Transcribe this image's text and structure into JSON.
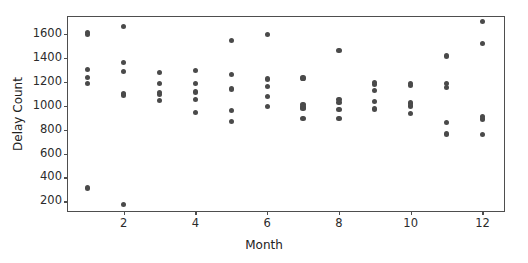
{
  "chart_data": {
    "type": "scatter",
    "title": "",
    "xlabel": "Month",
    "ylabel": "Delay Count",
    "xlim": [
      0.45,
      12.6
    ],
    "ylim": [
      120,
      1740
    ],
    "xticks": [
      2,
      4,
      6,
      8,
      10,
      12
    ],
    "yticks": [
      200,
      400,
      600,
      800,
      1000,
      1200,
      1400,
      1600
    ],
    "grid": false,
    "legend": null,
    "marker_color": "#4a4a4a",
    "frame_color": "#4e4e4e",
    "background": "#ffffff",
    "series": [
      {
        "name": "Delay Count",
        "points": [
          {
            "x": 1,
            "y": 1610
          },
          {
            "x": 1,
            "y": 1592
          },
          {
            "x": 1,
            "y": 1300
          },
          {
            "x": 1,
            "y": 1236
          },
          {
            "x": 1,
            "y": 1184
          },
          {
            "x": 1,
            "y": 312
          },
          {
            "x": 2,
            "y": 1663
          },
          {
            "x": 2,
            "y": 1357
          },
          {
            "x": 2,
            "y": 1283
          },
          {
            "x": 2,
            "y": 1098
          },
          {
            "x": 2,
            "y": 1088
          },
          {
            "x": 2,
            "y": 175
          },
          {
            "x": 3,
            "y": 1277
          },
          {
            "x": 3,
            "y": 1182
          },
          {
            "x": 3,
            "y": 1112
          },
          {
            "x": 3,
            "y": 1091
          },
          {
            "x": 3,
            "y": 1043
          },
          {
            "x": 4,
            "y": 1292
          },
          {
            "x": 4,
            "y": 1182
          },
          {
            "x": 4,
            "y": 1113
          },
          {
            "x": 4,
            "y": 1048
          },
          {
            "x": 4,
            "y": 945
          },
          {
            "x": 5,
            "y": 1541
          },
          {
            "x": 5,
            "y": 1262
          },
          {
            "x": 5,
            "y": 1139
          },
          {
            "x": 5,
            "y": 961
          },
          {
            "x": 5,
            "y": 868
          },
          {
            "x": 6,
            "y": 1596
          },
          {
            "x": 6,
            "y": 1222
          },
          {
            "x": 6,
            "y": 1160
          },
          {
            "x": 6,
            "y": 1077
          },
          {
            "x": 6,
            "y": 991
          },
          {
            "x": 7,
            "y": 1231
          },
          {
            "x": 7,
            "y": 1007
          },
          {
            "x": 7,
            "y": 988
          },
          {
            "x": 7,
            "y": 973
          },
          {
            "x": 7,
            "y": 893
          },
          {
            "x": 8,
            "y": 1461
          },
          {
            "x": 8,
            "y": 1051
          },
          {
            "x": 8,
            "y": 1026
          },
          {
            "x": 8,
            "y": 966
          },
          {
            "x": 8,
            "y": 891
          },
          {
            "x": 9,
            "y": 1196
          },
          {
            "x": 9,
            "y": 1176
          },
          {
            "x": 9,
            "y": 1128
          },
          {
            "x": 9,
            "y": 1037
          },
          {
            "x": 9,
            "y": 972
          },
          {
            "x": 10,
            "y": 1186
          },
          {
            "x": 10,
            "y": 1166
          },
          {
            "x": 10,
            "y": 1022
          },
          {
            "x": 10,
            "y": 997
          },
          {
            "x": 10,
            "y": 931
          },
          {
            "x": 11,
            "y": 1414
          },
          {
            "x": 11,
            "y": 1184
          },
          {
            "x": 11,
            "y": 1150
          },
          {
            "x": 11,
            "y": 862
          },
          {
            "x": 11,
            "y": 763
          },
          {
            "x": 12,
            "y": 1700
          },
          {
            "x": 12,
            "y": 1522
          },
          {
            "x": 12,
            "y": 912
          },
          {
            "x": 12,
            "y": 888
          },
          {
            "x": 12,
            "y": 762
          }
        ]
      }
    ]
  }
}
